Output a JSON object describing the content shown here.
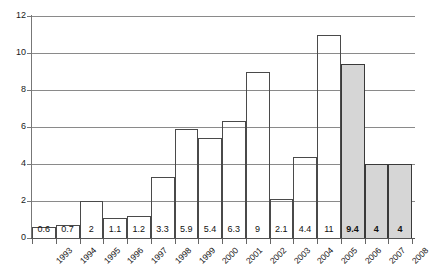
{
  "chart_data": {
    "type": "bar",
    "title": "",
    "subtitle": "",
    "xlabel": "",
    "ylabel": "",
    "categories": [
      "1993",
      "1994",
      "1995",
      "1996",
      "1997",
      "1998",
      "1999",
      "2000",
      "2001",
      "2002",
      "2003",
      "2004",
      "2005",
      "2006",
      "2007",
      "2008"
    ],
    "values": [
      0.6,
      0.7,
      2,
      1.1,
      1.2,
      3.3,
      5.9,
      5.4,
      6.3,
      9,
      2.1,
      4.4,
      11,
      9.4,
      4,
      4
    ],
    "data_labels": [
      "0.6",
      "0.7",
      "2",
      "1.1",
      "1.2",
      "3.3",
      "5.9",
      "5.4",
      "6.3",
      "9",
      "2.1",
      "4.4",
      "11",
      "9.4",
      "4",
      "4"
    ],
    "shaded": [
      false,
      false,
      false,
      false,
      false,
      false,
      false,
      false,
      false,
      false,
      false,
      false,
      false,
      true,
      true,
      true
    ],
    "ylim": [
      0,
      12
    ],
    "yticks": [
      0,
      2,
      4,
      6,
      8,
      10,
      12
    ],
    "ytick_labels": [
      "0",
      "2",
      "4",
      "6",
      "8",
      "10",
      "12"
    ],
    "grid": true,
    "legend": "none",
    "bar_fill_unshaded": "#ffffff",
    "bar_fill_shaded": "#d6d6d6",
    "bar_border_color": "#4a4a4a",
    "gridline_color": "#8a8a8a",
    "axis_color": "#555555"
  }
}
